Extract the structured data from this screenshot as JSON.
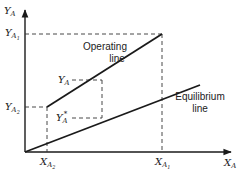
{
  "diagram": {
    "axes": {
      "y_label": "Y",
      "y_label_sub": "A",
      "x_label": "X",
      "x_label_sub": "A"
    },
    "y_ticks": [
      {
        "main": "Y",
        "sub": "A",
        "subsub": "1"
      },
      {
        "main": "Y",
        "sub": "A",
        "subsub": "2"
      }
    ],
    "x_ticks": [
      {
        "main": "X",
        "sub": "A",
        "subsub": "2"
      },
      {
        "main": "X",
        "sub": "A",
        "subsub": "1"
      }
    ],
    "points": {
      "ya": {
        "main": "Y",
        "sub": "A"
      },
      "ya_star": {
        "main": "Y",
        "sub": "A",
        "sup": "*"
      }
    },
    "lines": {
      "operating_line_1": "Operating",
      "operating_line_2": "line",
      "equilibrium_line_1": "Equilibrium",
      "equilibrium_line_2": "line"
    },
    "colors": {
      "line": "#1a1a1a",
      "dashed": "#333333"
    }
  }
}
